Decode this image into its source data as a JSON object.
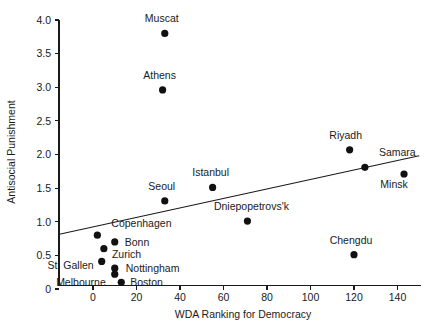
{
  "chart_data": {
    "type": "scatter",
    "title": "",
    "xlabel": "WDA Ranking for Democracy",
    "ylabel": "Antisocial Punishment",
    "xlim": [
      -18,
      152
    ],
    "ylim": [
      0,
      4.0
    ],
    "xticks": [
      0,
      20,
      40,
      60,
      80,
      100,
      120,
      140
    ],
    "xtick_labels": [
      "0",
      "20",
      "40",
      "60",
      "80",
      "100",
      "120",
      "140"
    ],
    "yticks": [
      0,
      0.5,
      1.0,
      1.5,
      2.0,
      2.5,
      3.0,
      3.5,
      4.0
    ],
    "ytick_labels": [
      "0",
      "0.5",
      "1.0",
      "1.5",
      "2.0",
      "2.5",
      "3.0",
      "3.5",
      "4.0"
    ],
    "grid": false,
    "legend": false,
    "marker": "filled-circle",
    "points": [
      {
        "label": "Muscat",
        "x": 33,
        "y": 3.8,
        "label_dx": -3,
        "label_dy": -11,
        "anchor": "middle"
      },
      {
        "label": "Athens",
        "x": 32,
        "y": 2.96,
        "label_dx": -3,
        "label_dy": -11,
        "anchor": "middle"
      },
      {
        "label": "Riyadh",
        "x": 118,
        "y": 2.07,
        "label_dx": -4,
        "label_dy": -11,
        "anchor": "middle"
      },
      {
        "label": "Samara",
        "x": 125,
        "y": 1.81,
        "label_dx": 14,
        "label_dy": -11,
        "anchor": "start"
      },
      {
        "label": "Minsk",
        "x": 143,
        "y": 1.71,
        "label_dx": -10,
        "label_dy": 14,
        "anchor": "middle"
      },
      {
        "label": "Istanbul",
        "x": 55,
        "y": 1.51,
        "label_dx": -2,
        "label_dy": -11,
        "anchor": "middle"
      },
      {
        "label": "Seoul",
        "x": 33,
        "y": 1.31,
        "label_dx": -3,
        "label_dy": -11,
        "anchor": "middle"
      },
      {
        "label": "Dniepopetrovs'k",
        "x": 71,
        "y": 1.01,
        "label_dx": 4,
        "label_dy": -11,
        "anchor": "middle"
      },
      {
        "label": "Copenhagen",
        "x": 2,
        "y": 0.8,
        "label_dx": 14,
        "label_dy": -8,
        "anchor": "start"
      },
      {
        "label": "Bonn",
        "x": 10,
        "y": 0.7,
        "label_dx": 10,
        "label_dy": 4,
        "anchor": "start"
      },
      {
        "label": "Zurich",
        "x": 5,
        "y": 0.6,
        "label_dx": 8,
        "label_dy": 9,
        "anchor": "start"
      },
      {
        "label": "Chengdu",
        "x": 120,
        "y": 0.51,
        "label_dx": -3,
        "label_dy": -11,
        "anchor": "middle"
      },
      {
        "label": "St. Gallen",
        "x": 4,
        "y": 0.41,
        "label_dx": -8,
        "label_dy": 8,
        "anchor": "end"
      },
      {
        "label": "Nottingham",
        "x": 10,
        "y": 0.31,
        "label_dx": 11,
        "label_dy": 4,
        "anchor": "start"
      },
      {
        "label": "Melbourne",
        "x": 10,
        "y": 0.22,
        "label_dx": -9,
        "label_dy": 12,
        "anchor": "end"
      },
      {
        "label": "Boston",
        "x": 13,
        "y": 0.1,
        "label_dx": 9,
        "label_dy": 4,
        "anchor": "start"
      }
    ],
    "fit_line": {
      "name": "linear-regression",
      "x_start": -16,
      "y_start": 0.81,
      "x_end": 150,
      "y_end": 1.98
    }
  },
  "colors": {
    "background": "#ffffff",
    "axis": "#1a1a1a",
    "marker": "#111111",
    "fit_line": "#1a1a1a",
    "text": "#1a1a1a"
  }
}
